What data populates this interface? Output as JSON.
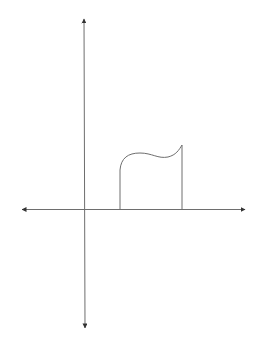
{
  "diagram": {
    "type": "area-under-curve-sketch",
    "background": "#ffffff",
    "stroke_color": "#6e6e6e",
    "arrow_color": "#333333",
    "axes": {
      "x_axis": {
        "y": 209.5,
        "x_start": 22,
        "x_end": 245,
        "arrows": "both"
      },
      "y_axis": {
        "x": 84,
        "y_start": 19,
        "y_end": 328,
        "arrows": "both"
      }
    },
    "region": {
      "left_bound_x": 120,
      "right_bound_x": 182,
      "baseline_y": 209.5,
      "left_top_y": 170,
      "right_top_y": 145,
      "curve_path": "M120,170 C121,158 128,153 140,153 C152,153 158,159 168,157 C176,155 179,150 182,145"
    },
    "labels": []
  }
}
